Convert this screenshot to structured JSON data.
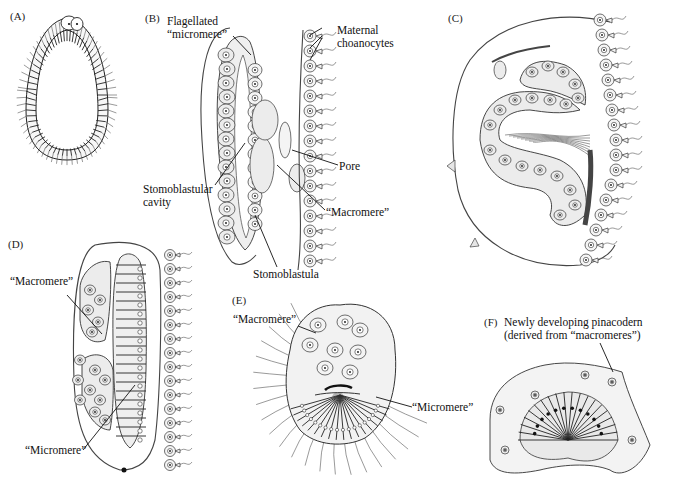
{
  "figure": {
    "panels": [
      {
        "id": "A",
        "label": "(A)",
        "annotations": []
      },
      {
        "id": "B",
        "label": "(B)",
        "annotations": [
          {
            "text_lines": [
              "Flagellated",
              "“micromere”"
            ]
          },
          {
            "text_lines": [
              "Maternal",
              "choanocytes"
            ]
          },
          {
            "text_lines": [
              "Pore"
            ]
          },
          {
            "text_lines": [
              "Stomoblastular",
              "cavity"
            ]
          },
          {
            "text_lines": [
              "“Macromere”"
            ]
          },
          {
            "text_lines": [
              "Stomoblastula"
            ]
          }
        ]
      },
      {
        "id": "C",
        "label": "(C)",
        "annotations": []
      },
      {
        "id": "D",
        "label": "(D)",
        "annotations": [
          {
            "text_lines": [
              "“Macromere”"
            ]
          },
          {
            "text_lines": [
              "“Micromere”"
            ]
          }
        ]
      },
      {
        "id": "E",
        "label": "(E)",
        "annotations": [
          {
            "text_lines": [
              "“Macromere”"
            ]
          },
          {
            "text_lines": [
              "“Micromere”"
            ]
          }
        ]
      },
      {
        "id": "F",
        "label": "(F)",
        "annotations": [
          {
            "text_lines": [
              "Newly developing pinacodern",
              "(derived from “macromeres”)"
            ]
          }
        ]
      }
    ]
  }
}
